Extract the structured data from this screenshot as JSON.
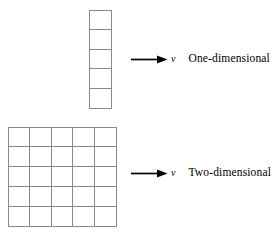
{
  "figure": {
    "background_color": "#ffffff",
    "line_color": "#8a8a8a",
    "arrow_color": "#000000",
    "text_color": "#000000"
  },
  "diagrams": [
    {
      "id": "one-dimensional",
      "grid": {
        "rows": 5,
        "cols": 5,
        "shape": "column"
      },
      "arrow": {
        "direction": "right",
        "icon": "right-arrow-icon"
      },
      "velocity_symbol": "v",
      "label": "One-dimensional"
    },
    {
      "id": "two-dimensional",
      "grid": {
        "rows": 5,
        "cols": 5,
        "shape": "square"
      },
      "arrow": {
        "direction": "right",
        "icon": "right-arrow-icon"
      },
      "velocity_symbol": "v",
      "label": "Two-dimensional"
    }
  ]
}
